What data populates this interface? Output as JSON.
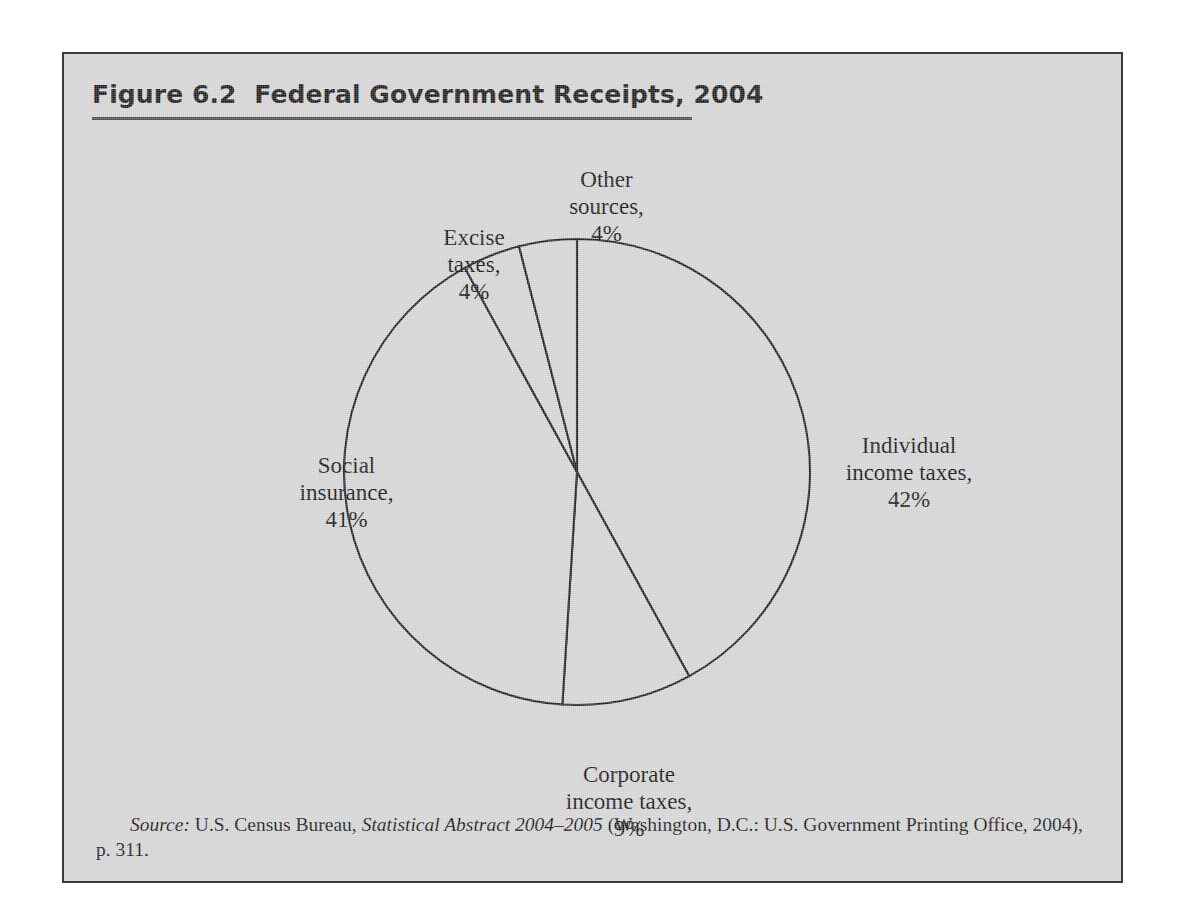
{
  "figure": {
    "title": "Figure 6.2  Federal Government Receipts, 2004",
    "frame_border_color": "#3a3a3a",
    "background_color": "#d2d2d2",
    "rule_color": "#4a4a4a"
  },
  "chart_data": {
    "type": "pie",
    "title": "Federal Government Receipts, 2004",
    "units": "percent of total receipts",
    "start_angle_deg": 0,
    "direction": "clockwise",
    "legend": "none-inline-labels",
    "categories": [
      "Individual income taxes",
      "Corporate income taxes",
      "Social insurance",
      "Excise taxes",
      "Other sources"
    ],
    "values": [
      42,
      9,
      41,
      4,
      4
    ],
    "slices": [
      {
        "name": "Individual income taxes",
        "value": 42,
        "value_label": "42%",
        "label_text": "Individual\nincome taxes,\n42%",
        "start_deg": 0.0,
        "end_deg": 151.2
      },
      {
        "name": "Corporate income taxes",
        "value": 9,
        "value_label": "9%",
        "label_text": "Corporate\nincome taxes,\n9%",
        "start_deg": 151.2,
        "end_deg": 183.6
      },
      {
        "name": "Social insurance",
        "value": 41,
        "value_label": "41%",
        "label_text": "Social\ninsurance,\n41%",
        "start_deg": 183.6,
        "end_deg": 331.2
      },
      {
        "name": "Excise taxes",
        "value": 4,
        "value_label": "4%",
        "label_text": "Excise\ntaxes,\n4%",
        "start_deg": 331.2,
        "end_deg": 345.6
      },
      {
        "name": "Other sources",
        "value": 4,
        "value_label": "4%",
        "label_text": "Other\nsources,\n4%",
        "start_deg": 345.6,
        "end_deg": 360.0
      }
    ],
    "slice_fill": "#d2d2d2",
    "slice_stroke": "#1e1e1e"
  },
  "source": {
    "prefix": "Source:",
    "publisher": " U.S. Census Bureau, ",
    "work": "Statistical Abstract 2004–2005",
    "rest": " (Washington, D.C.: U.S. Government Printing Office, 2004), p. 311."
  }
}
